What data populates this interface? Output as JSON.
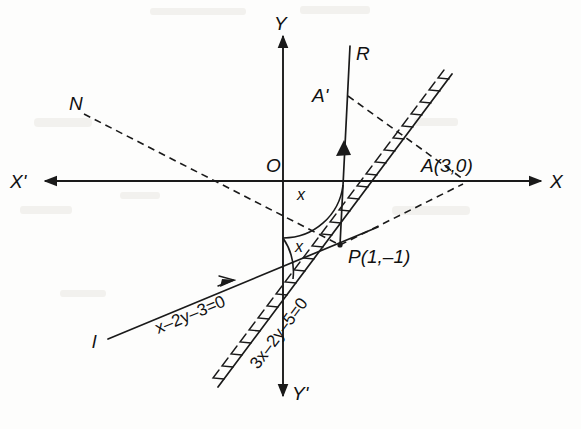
{
  "figure": {
    "kind": "coordinate-geometry-diagram",
    "ink_color": "#1a1a1a",
    "paper_color": "#fdfdfc"
  },
  "axes": {
    "x_positive_label": "X",
    "x_negative_label": "X'",
    "y_positive_label": "Y",
    "y_negative_label": "Y'",
    "origin_label": "O"
  },
  "points": [
    {
      "name": "origin",
      "label": "O",
      "x": 283,
      "y": 181
    },
    {
      "name": "point-a",
      "label": "A(3,0)",
      "x": 465,
      "y": 182
    },
    {
      "name": "point-p",
      "label": "P(1,–1)",
      "x": 340,
      "y": 245
    },
    {
      "name": "point-a-prime",
      "label": "A'",
      "x": 340,
      "y": 96
    }
  ],
  "rays": [
    {
      "name": "ray-r",
      "label": "R"
    },
    {
      "name": "ray-n",
      "label": "N"
    },
    {
      "name": "line-l",
      "label": "l"
    }
  ],
  "equations": [
    {
      "name": "line-l-equation",
      "text": "x–2y–3=0"
    },
    {
      "name": "mirror-line-equation",
      "text": "3x–2y–5=0"
    }
  ],
  "angles": [
    {
      "name": "angle-upper",
      "label": "x"
    },
    {
      "name": "angle-lower",
      "label": "x"
    }
  ]
}
